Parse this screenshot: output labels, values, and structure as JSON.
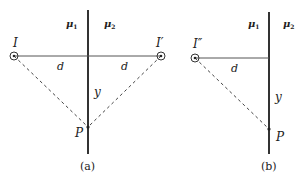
{
  "panels": [
    {
      "id": "a",
      "caption": "(a)",
      "media_left": "μ",
      "media_left_sub": "1",
      "media_right": "μ",
      "media_right_sub": "2",
      "source_label": "I",
      "image_label": "I′",
      "distance_left": "d",
      "distance_right": "d",
      "vertical_distance": "y",
      "point_label": "P"
    },
    {
      "id": "b",
      "caption": "(b)",
      "media_left": "μ",
      "media_left_sub": "1",
      "media_right": "μ",
      "media_right_sub": "2",
      "image_label": "I″",
      "distance": "d",
      "vertical_distance": "y",
      "point_label": "P"
    }
  ],
  "colors": {
    "line": "#333333",
    "text": "#222222",
    "background": "#ffffff"
  }
}
